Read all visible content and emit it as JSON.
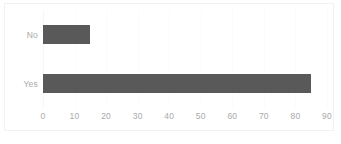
{
  "chart_data": {
    "type": "bar",
    "orientation": "horizontal",
    "title": "",
    "xlabel": "",
    "ylabel": "",
    "categories": [
      "No",
      "Yes"
    ],
    "values": [
      15,
      85
    ],
    "series": [
      {
        "name": "",
        "values": [
          15,
          85
        ]
      }
    ],
    "xlim": [
      0,
      90
    ],
    "xticks": [
      0,
      10,
      20,
      30,
      40,
      50,
      60,
      70,
      80,
      90
    ],
    "xtick_labels": [
      "0",
      "10",
      "20",
      "30",
      "40",
      "50",
      "60",
      "70",
      "80",
      "90"
    ],
    "grid": true,
    "grid_axis": "x",
    "legend": false,
    "legend_position": "none",
    "bar_color": "#595959",
    "label_color": "#a9a9a9",
    "gridline_color": "#fbfbfb",
    "frame_color": "#f2f2f2",
    "background_color": "#ffffff"
  }
}
